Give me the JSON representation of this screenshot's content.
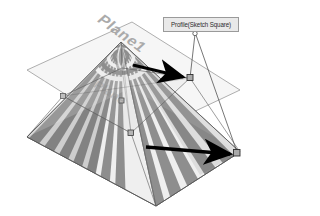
{
  "figure": {
    "type": "cad-3d-viewport",
    "background_color": "#ffffff"
  },
  "labels": {
    "plane_top": "Plane1",
    "plane_mid": "Plane",
    "callout": "Profile(Sketch Square)"
  },
  "colors": {
    "plane_fill": "#f3f3f3",
    "plane_border": "#9a9a9a",
    "stripe_dark": "#8e8e8e",
    "stripe_light": "#efefef",
    "arrow": "#000000",
    "callout_bg": "#e9e9e9",
    "callout_border": "#9a9a9a",
    "callout_text": "#2b2b2b",
    "leader_line": "#4a4a4a",
    "handle_fill": "#a9a9a9",
    "handle_border": "#2f2f2f"
  },
  "geometry": {
    "top_plane": {
      "name": "upper-reference-plane",
      "points": "27,70 132,22 240,90 136,139"
    },
    "bottom_plane": {
      "name": "lower-reference-plane",
      "points": "27,137 131,88 240,152 156,206"
    },
    "pyramid": {
      "name": "lofted-pyramid",
      "apex": {
        "x": 121,
        "y": 42
      },
      "base": "27,137 131,88 240,152 156,206"
    }
  },
  "annotations": {
    "arrows": [
      {
        "name": "arrow-to-profile-handle",
        "from": {
          "x": 136,
          "y": 66
        },
        "to": {
          "x": 189,
          "y": 77
        }
      },
      {
        "name": "arrow-to-base-corner",
        "from": {
          "x": 150,
          "y": 148
        },
        "to": {
          "x": 236,
          "y": 154
        }
      }
    ],
    "leader_lines": [
      {
        "name": "leader-to-profile-handle",
        "from": {
          "x": 194,
          "y": 35
        },
        "to": {
          "x": 190,
          "y": 78
        }
      },
      {
        "name": "leader-to-base-corner",
        "from": {
          "x": 196,
          "y": 36
        },
        "to": {
          "x": 238,
          "y": 153
        }
      }
    ],
    "leader_origin": {
      "x": 195,
      "y": 34
    },
    "handles": [
      {
        "name": "sketch-handle-upper",
        "x": 190,
        "y": 78
      },
      {
        "name": "sketch-handle-base-right",
        "x": 237,
        "y": 153
      },
      {
        "name": "sketch-handle-base-front",
        "x": 131,
        "y": 133
      },
      {
        "name": "sketch-handle-mid",
        "x": 122,
        "y": 101
      }
    ]
  }
}
